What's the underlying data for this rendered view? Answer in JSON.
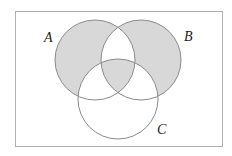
{
  "diagram": {
    "type": "venn-3",
    "sets": [
      {
        "id": "A",
        "label": "A"
      },
      {
        "id": "B",
        "label": "B"
      },
      {
        "id": "C",
        "label": "C"
      }
    ],
    "shaded_regions": [
      "A only (excluding C)",
      "B only (excluding C)",
      "A∩B∩C"
    ],
    "unshaded_regions": [
      "A∩B excluding C",
      "A∩C excluding B",
      "B∩C excluding A",
      "C only"
    ],
    "colors": {
      "shade": "#d8d8d8",
      "stroke": "#8a8a8a",
      "frame": "#b0b0b0",
      "background": "#ffffff"
    }
  }
}
